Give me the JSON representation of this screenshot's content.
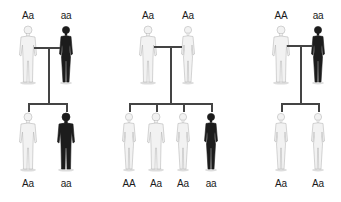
{
  "colors": {
    "affected": "#1c1c1c",
    "unaffected": "#f2f2f2",
    "outline": "#b8b8b8",
    "line": "#444444",
    "background": "#ffffff"
  },
  "panels": [
    {
      "parents": [
        {
          "genotype": "Aa",
          "sex": "male",
          "phenotype": "unaffected",
          "x": 28
        },
        {
          "genotype": "aa",
          "sex": "female",
          "phenotype": "affected",
          "x": 66
        }
      ],
      "cross": {
        "y": 47,
        "stem_x": 48,
        "bar_y": 103
      },
      "children": [
        {
          "genotype": "Aa",
          "sex": "male",
          "phenotype": "unaffected",
          "x": 28
        },
        {
          "genotype": "aa",
          "sex": "male",
          "phenotype": "affected",
          "x": 66
        }
      ]
    },
    {
      "parents": [
        {
          "genotype": "Aa",
          "sex": "male",
          "phenotype": "unaffected",
          "x": 148
        },
        {
          "genotype": "Aa",
          "sex": "female",
          "phenotype": "unaffected",
          "x": 188
        }
      ],
      "cross": {
        "y": 46,
        "stem_x": 170,
        "bar_y": 103
      },
      "children": [
        {
          "genotype": "AA",
          "sex": "female",
          "phenotype": "unaffected",
          "x": 129
        },
        {
          "genotype": "Aa",
          "sex": "male",
          "phenotype": "unaffected",
          "x": 156
        },
        {
          "genotype": "Aa",
          "sex": "female",
          "phenotype": "unaffected",
          "x": 183
        },
        {
          "genotype": "aa",
          "sex": "female",
          "phenotype": "affected",
          "x": 211
        }
      ]
    },
    {
      "parents": [
        {
          "genotype": "AA",
          "sex": "male",
          "phenotype": "unaffected",
          "x": 281
        },
        {
          "genotype": "aa",
          "sex": "female",
          "phenotype": "affected",
          "x": 318
        }
      ],
      "cross": {
        "y": 45,
        "stem_x": 300,
        "bar_y": 103
      },
      "children": [
        {
          "genotype": "Aa",
          "sex": "female",
          "phenotype": "unaffected",
          "x": 281
        },
        {
          "genotype": "Aa",
          "sex": "female",
          "phenotype": "unaffected",
          "x": 318
        }
      ]
    }
  ]
}
